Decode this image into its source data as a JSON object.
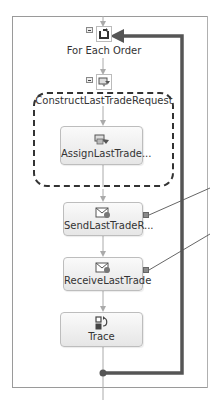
{
  "diagram": {
    "type": "workflow",
    "nodes": {
      "for_each": {
        "label": "For Each Order",
        "icon": "loop-icon"
      },
      "construct": {
        "label": "ConstructLastTradeRequest",
        "icon": "construct-message-icon"
      },
      "assign": {
        "label": "AssignLastTrade...",
        "icon": "assign-icon"
      },
      "send": {
        "label": "SendLastTradeR...",
        "icon": "send-message-icon"
      },
      "receive": {
        "label": "ReceiveLastTrade",
        "icon": "receive-message-icon"
      },
      "trace": {
        "label": "Trace",
        "icon": "trace-icon"
      }
    },
    "colors": {
      "loop_line": "#555555",
      "connector": "#aaaaaa",
      "port": "#8a8a8a",
      "group_border": "#333333"
    }
  }
}
